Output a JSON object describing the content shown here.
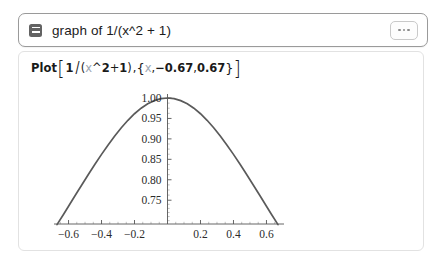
{
  "query": {
    "text": "graph of 1/(x^2 + 1)",
    "type_icon": "list-card-icon",
    "menu_icon": "ellipsis-icon",
    "menu_dots": [
      "dot",
      "dot",
      "dot"
    ]
  },
  "expression": {
    "function_name": "Plot",
    "open_bracket": "[",
    "numerator": "1",
    "slash": "/",
    "open_paren": "(",
    "var1": "x",
    "caret": "^",
    "power": "2",
    "plus": " + ",
    "one": "1",
    "close_paren": ")",
    "comma1": ", ",
    "open_brace": "{",
    "var2": "x",
    "comma2": ", ",
    "xmin": "−0.67",
    "comma3": ", ",
    "xmax": "0.67",
    "close_brace": "}",
    "close_bracket": "]",
    "full_text": "Plot[1/(x^2 + 1), {x, -0.67, 0.67}]"
  },
  "colors": {
    "curve": "#5a5a5a",
    "axis": "#555555",
    "minor_tick": "#a8a8a8",
    "query_border": "#9a9a9a",
    "result_border": "#e2e2e2",
    "icon_fill": "#636363",
    "variable_text": "#9aa6b2"
  },
  "chart_data": {
    "type": "line",
    "title": "",
    "xlabel": "",
    "ylabel": "",
    "expression": "1/(x^2 + 1)",
    "xlim": [
      -0.67,
      0.67
    ],
    "ylim": [
      0.6918,
      1.0
    ],
    "grid": false,
    "legend": null,
    "axis_style": "mathematica-cross-axes",
    "y_axis_at_x": 0,
    "x_ticks": [
      -0.6,
      -0.4,
      -0.2,
      0.2,
      0.4,
      0.6
    ],
    "x_tick_labels": [
      "−0.6",
      "−0.4",
      "−0.2",
      "0.2",
      "0.4",
      "0.6"
    ],
    "x_minor_tick_count_between": 3,
    "y_ticks": [
      0.75,
      0.8,
      0.85,
      0.9,
      0.95,
      1.0
    ],
    "y_tick_labels": [
      "0.75",
      "0.80",
      "0.85",
      "0.90",
      "0.95",
      "1.00"
    ],
    "y_minor_tick_count_between": 3,
    "series": [
      {
        "name": "1/(x^2 + 1)",
        "color": "#5a5a5a",
        "x": [
          -0.67,
          -0.63,
          -0.6,
          -0.56,
          -0.52,
          -0.48,
          -0.44,
          -0.4,
          -0.36,
          -0.32,
          -0.28,
          -0.24,
          -0.2,
          -0.16,
          -0.12,
          -0.08,
          -0.04,
          0.0,
          0.04,
          0.08,
          0.12,
          0.16,
          0.2,
          0.24,
          0.28,
          0.32,
          0.36,
          0.4,
          0.44,
          0.48,
          0.52,
          0.56,
          0.6,
          0.63,
          0.67
        ],
        "y": [
          0.6902,
          0.7157,
          0.7353,
          0.7614,
          0.7872,
          0.8128,
          0.8378,
          0.8621,
          0.8853,
          0.9071,
          0.9274,
          0.9455,
          0.9615,
          0.975,
          0.9858,
          0.9936,
          0.9984,
          1.0,
          0.9984,
          0.9936,
          0.9858,
          0.975,
          0.9615,
          0.9455,
          0.9274,
          0.9071,
          0.8853,
          0.8621,
          0.8378,
          0.8128,
          0.7872,
          0.7614,
          0.7353,
          0.7157,
          0.6902
        ]
      }
    ]
  }
}
